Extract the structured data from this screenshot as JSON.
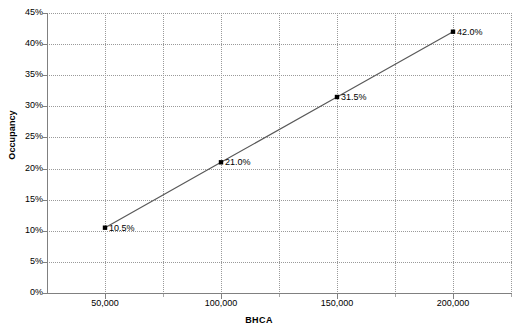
{
  "chart_data": {
    "type": "line",
    "title": "",
    "xlabel": "BHCA",
    "ylabel": "Occupancy",
    "x": [
      50000,
      100000,
      150000,
      200000
    ],
    "values": [
      10.5,
      21.0,
      31.5,
      42.0
    ],
    "point_labels": [
      "10.5%",
      "21.0%",
      "31.5%",
      "42.0%"
    ],
    "series": [
      {
        "name": "Occupancy",
        "x": [
          50000,
          100000,
          150000,
          200000
        ],
        "values": [
          10.5,
          21.0,
          31.5,
          42.0
        ]
      }
    ],
    "xlim": [
      25000,
      225000
    ],
    "ylim": [
      0,
      45
    ],
    "x_tick_labels": [
      "50,000",
      "100,000",
      "150,000",
      "200,000"
    ],
    "x_ticks": [
      50000,
      100000,
      150000,
      200000
    ],
    "x_minor_ticks": [
      75000,
      125000,
      175000,
      225000
    ],
    "y_tick_labels": [
      "45%",
      "40%",
      "35%",
      "30%",
      "25%",
      "20%",
      "15%",
      "10%",
      "5%",
      "0%"
    ],
    "y_ticks": [
      45,
      40,
      35,
      30,
      25,
      20,
      15,
      10,
      5,
      0
    ],
    "grid": true,
    "grid_color": "#9a9a9a",
    "legend": "none",
    "line_color": "#595959",
    "marker_color": "#000000",
    "marker": "square",
    "axis_color": "#808080",
    "background": "#ffffff"
  }
}
